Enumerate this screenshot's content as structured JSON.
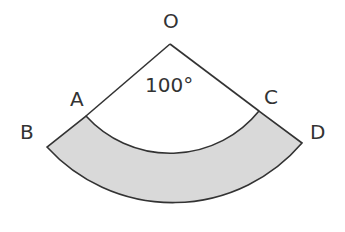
{
  "diagram": {
    "type": "annular-sector",
    "labels": {
      "O": "O",
      "A": "A",
      "B": "B",
      "C": "C",
      "D": "D"
    },
    "angle_label": "100°",
    "shaded_region": "ABDC",
    "colors": {
      "stroke": "#333333",
      "fill": "#d9d9d9",
      "background": "#ffffff"
    }
  }
}
